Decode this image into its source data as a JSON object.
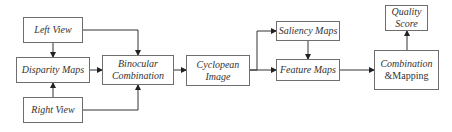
{
  "diagram": {
    "nodes": {
      "left_view": {
        "label": "Left View"
      },
      "disparity_maps": {
        "label": "Disparity Maps"
      },
      "right_view": {
        "label": "Right View"
      },
      "binocular_combination": {
        "line1": "Binocular",
        "line2": "Combination"
      },
      "cyclopean_image": {
        "line1": "Cyclopean",
        "line2": "Image"
      },
      "saliency_maps": {
        "label": "Saliency Maps"
      },
      "feature_maps": {
        "label": "Feature Maps"
      },
      "combination_mapping": {
        "line1": "Combination",
        "line2": "&Mapping"
      },
      "quality_score": {
        "line1": "Quality",
        "line2": "Score"
      }
    },
    "edges": [
      {
        "from": "Left View",
        "to": "Disparity Maps"
      },
      {
        "from": "Right View",
        "to": "Disparity Maps"
      },
      {
        "from": "Left View",
        "to": "Binocular Combination"
      },
      {
        "from": "Disparity Maps",
        "to": "Binocular Combination"
      },
      {
        "from": "Right View",
        "to": "Binocular Combination"
      },
      {
        "from": "Binocular Combination",
        "to": "Cyclopean Image"
      },
      {
        "from": "Cyclopean Image",
        "to": "Saliency Maps"
      },
      {
        "from": "Cyclopean Image",
        "to": "Feature Maps"
      },
      {
        "from": "Saliency Maps",
        "to": "Feature Maps"
      },
      {
        "from": "Feature Maps",
        "to": "Combination &Mapping"
      },
      {
        "from": "Combination &Mapping",
        "to": "Quality Score"
      }
    ]
  }
}
